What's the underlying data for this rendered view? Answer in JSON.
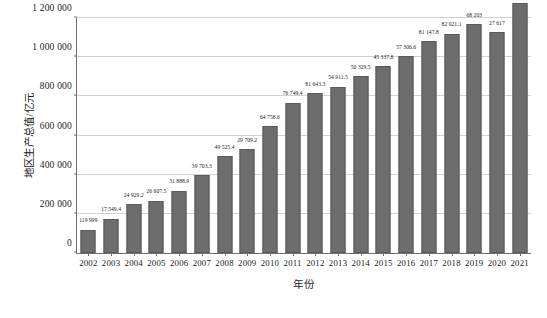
{
  "chart_data": {
    "type": "bar",
    "title": "",
    "xlabel": "年份",
    "ylabel": "地区生产总值/亿元",
    "categories": [
      "2002",
      "2003",
      "2004",
      "2005",
      "2006",
      "2007",
      "2008",
      "2009",
      "2010",
      "2011",
      "2012",
      "2013",
      "2014",
      "2015",
      "2016",
      "2017",
      "2018",
      "2019",
      "2020",
      "2021"
    ],
    "values": [
      119999,
      175494,
      249292,
      266075,
      318889,
      397033,
      495254,
      529709,
      647586,
      767494,
      816433,
      849115,
      903295,
      953378,
      1003966,
      1081478,
      1120211,
      1168203,
      1127617,
      1278059
    ],
    "value_labels": [
      "119 999",
      "17 549.4",
      "24 929.2",
      "26 607.5",
      "31 888.9",
      "39 703.3",
      "49 525.4",
      "29 709.2",
      "64 758.6",
      "76 749.4",
      "81 643.3",
      "54 911.5",
      "50 329.5",
      "45 337.8",
      "57 306.6",
      "81 147.8",
      "82 021.1",
      "68 203",
      "27 617",
      "127 805.9"
    ],
    "ylim": [
      0,
      1200000
    ],
    "ytick_values": [
      0,
      200000,
      400000,
      600000,
      800000,
      1000000,
      1200000
    ],
    "ytick_labels": [
      "0",
      "200 000",
      "400 000",
      "600 000",
      "800 000",
      "1 000 000",
      "1 200 000"
    ],
    "grid": true,
    "legend": null,
    "bar_color": "#6d6d6d",
    "bar_edge_color": "#5a5a5a",
    "grid_color": "#d2d2d2",
    "axis_color": "#6e6e6e"
  },
  "caption": ""
}
